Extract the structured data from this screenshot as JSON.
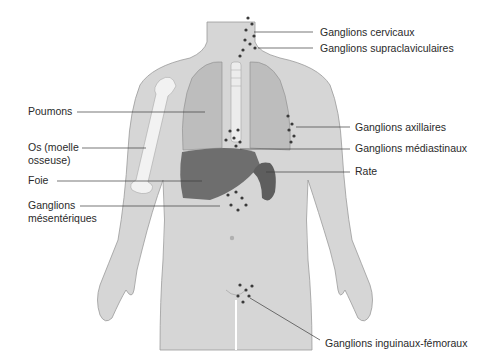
{
  "figure": {
    "colors": {
      "skin": "#d6d6d6",
      "skin_outline": "#9a9a9a",
      "lung": "#bdbdbd",
      "liver": "#6e6e6e",
      "spleen": "#5e5e5e",
      "bone": "#f2f2f2",
      "node": "#3a3a3a",
      "leader_line": "#3c3c3c",
      "text": "#2a2a2a"
    }
  },
  "labels": {
    "left": [
      {
        "id": "poumons",
        "text": "Poumons"
      },
      {
        "id": "os_1",
        "text": "Os (moelle"
      },
      {
        "id": "os_2",
        "text": "osseuse)"
      },
      {
        "id": "foie",
        "text": "Foie"
      },
      {
        "id": "mes_1",
        "text": "Ganglions"
      },
      {
        "id": "mes_2",
        "text": "mésentériques"
      }
    ],
    "right": [
      {
        "id": "cervicaux",
        "text": "Ganglions cervicaux"
      },
      {
        "id": "supraclav",
        "text": "Ganglions supraclaviculaires"
      },
      {
        "id": "axillaires",
        "text": "Ganglions axillaires"
      },
      {
        "id": "mediastinaux",
        "text": "Ganglions médiastinaux"
      },
      {
        "id": "rate",
        "text": "Rate"
      },
      {
        "id": "inguinaux",
        "text": "Ganglions inguinaux-fémoraux"
      }
    ]
  }
}
